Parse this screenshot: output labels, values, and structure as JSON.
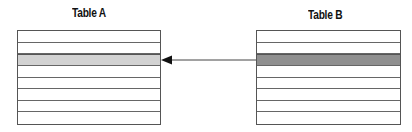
{
  "diagram": {
    "tables": [
      {
        "title": "Table A",
        "row_count": 8,
        "highlighted_row": 2,
        "highlight_color": "#d2d2d2"
      },
      {
        "title": "Table B",
        "row_count": 8,
        "highlighted_row": 2,
        "highlight_color": "#8f8f8f"
      }
    ],
    "arrow": {
      "from": "Table B row 3",
      "to": "Table A row 3",
      "color": "#444444"
    }
  }
}
